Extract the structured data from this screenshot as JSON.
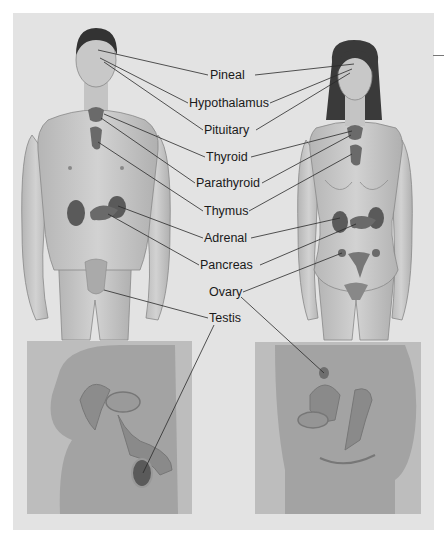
{
  "figure": {
    "background_color": "#e3e3e3",
    "skin_color": "#c9c9c9",
    "gland_color": "#6a6a6a"
  },
  "labels": [
    {
      "id": "pineal",
      "text": "Pineal",
      "x": 210,
      "y": 68
    },
    {
      "id": "hypothalamus",
      "text": "Hypothalamus",
      "x": 189,
      "y": 96
    },
    {
      "id": "pituitary",
      "text": "Pituitary",
      "x": 204,
      "y": 123
    },
    {
      "id": "thyroid",
      "text": "Thyroid",
      "x": 206,
      "y": 150
    },
    {
      "id": "parathyroid",
      "text": "Parathyroid",
      "x": 196,
      "y": 176
    },
    {
      "id": "thymus",
      "text": "Thymus",
      "x": 204,
      "y": 204
    },
    {
      "id": "adrenal",
      "text": "Adrenal",
      "x": 204,
      "y": 231
    },
    {
      "id": "pancreas",
      "text": "Pancreas",
      "x": 200,
      "y": 258
    },
    {
      "id": "ovary",
      "text": "Ovary",
      "x": 209,
      "y": 285
    },
    {
      "id": "testis",
      "text": "Testis",
      "x": 209,
      "y": 311
    }
  ],
  "figures": {
    "male": {
      "label": "Male figure"
    },
    "female": {
      "label": "Female figure"
    }
  },
  "insets": {
    "male": {
      "label": "Male pelvic cross-section"
    },
    "female": {
      "label": "Female pelvic cross-section"
    }
  }
}
